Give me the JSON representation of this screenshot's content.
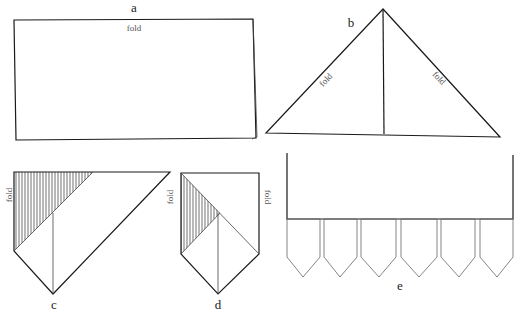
{
  "figure": {
    "panels": [
      {
        "id": "a",
        "label": "a",
        "fold_labels": [
          "fold"
        ],
        "description": "rectangle folded in half along top edge"
      },
      {
        "id": "b",
        "label": "b",
        "fold_labels": [
          "fold",
          "fold"
        ],
        "description": "triangle with two diagonal folds and center crease"
      },
      {
        "id": "c",
        "label": "c",
        "fold_labels": [
          "fold"
        ],
        "description": "folded shape with shaded triangle"
      },
      {
        "id": "d",
        "label": "d",
        "fold_labels": [
          "fold",
          "fold"
        ],
        "description": "pentagon point with shaded triangle"
      },
      {
        "id": "e",
        "label": "e",
        "fold_labels": [],
        "description": "strip with six pointed tabs",
        "tab_count": 6
      }
    ]
  },
  "colors": {
    "line": "#1a1a1a",
    "thin_line": "#444444",
    "text": "#222222",
    "background": "#ffffff"
  }
}
